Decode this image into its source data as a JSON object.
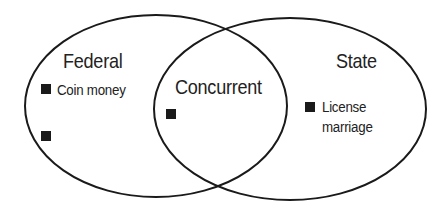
{
  "diagram": {
    "type": "venn",
    "stroke_color": "#1a1a1a",
    "sets": [
      {
        "id": "federal",
        "title": "Federal",
        "items": [
          "Coin money",
          ""
        ]
      },
      {
        "id": "concurrent",
        "title": "Concurrent",
        "items": [
          ""
        ]
      },
      {
        "id": "state",
        "title": "State",
        "items": [
          "License marriage"
        ]
      }
    ]
  },
  "federal": {
    "title": "Federal",
    "item_1": "Coin money",
    "item_2": ""
  },
  "concurrent": {
    "title": "Concurrent",
    "item_1": ""
  },
  "state": {
    "title": "State",
    "item_1_line1": "License",
    "item_1_line2": "marriage"
  }
}
